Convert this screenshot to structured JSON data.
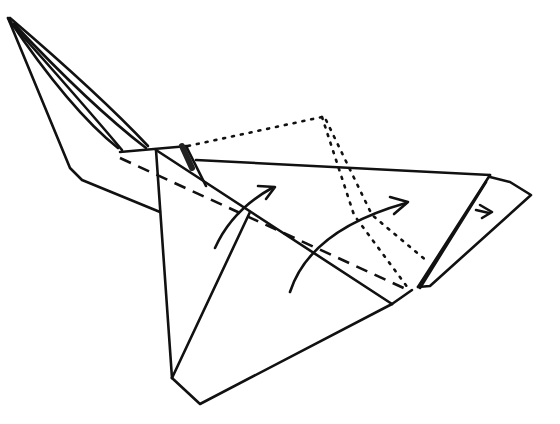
{
  "diagram": {
    "type": "origami-fold-step",
    "background": "#ffffff",
    "stroke_color": "#111111",
    "width": 560,
    "height": 424,
    "solid_paths": [
      {
        "name": "tail-outer-edge",
        "d": "M8 18 L70 168 L82 180 L160 212"
      },
      {
        "name": "tail-inner-edge-1",
        "d": "M8 18 Q70 110 118 148"
      },
      {
        "name": "tail-inner-edge-2",
        "d": "M10 22 Q80 100 122 150"
      },
      {
        "name": "tail-inner-edge-3",
        "d": "M14 24 Q90 105 146 148"
      },
      {
        "name": "tail-top-edge",
        "d": "M10 18 Q100 95 148 146"
      },
      {
        "name": "center-top-edge",
        "d": "M120 152 L188 146"
      },
      {
        "name": "nose-notch",
        "d": "M186 146 L196 166 L206 186"
      },
      {
        "name": "main-top-edge",
        "d": "M196 160 L490 175"
      },
      {
        "name": "left-body-edge",
        "d": "M156 150 L172 378"
      },
      {
        "name": "left-lower-crease",
        "d": "M172 378 L250 212"
      },
      {
        "name": "bottom-edge",
        "d": "M172 378 L200 404 L392 304"
      },
      {
        "name": "diagonal-center-crease",
        "d": "M156 150 L392 304"
      },
      {
        "name": "right-lower-edge",
        "d": "M392 304 L412 290"
      },
      {
        "name": "right-layer-edge-1",
        "d": "M490 175 L418 287"
      },
      {
        "name": "right-layer-edge-2",
        "d": "M486 182 L420 288"
      },
      {
        "name": "right-flap-outline",
        "d": "M490 177 L510 182 L531 195 L430 286 L418 287"
      }
    ],
    "dashed_paths": [
      {
        "name": "valley-fold-line",
        "d": "M120 158 L408 290"
      }
    ],
    "dotted_paths": [
      {
        "name": "hidden-edge-top",
        "d": "M188 146 L322 117"
      },
      {
        "name": "hidden-edge-right-1",
        "d": "M322 117 L354 215 L408 288"
      },
      {
        "name": "hidden-edge-right-2",
        "d": "M326 120 L372 215 L428 262"
      }
    ],
    "arrows": [
      {
        "name": "fold-arrow-left",
        "d": "M215 248 Q232 210 272 188",
        "head": "M258 186 L275 187 L266 199"
      },
      {
        "name": "fold-arrow-center",
        "d": "M290 292 Q310 230 406 203",
        "head": "M390 197 L408 202 L394 214"
      },
      {
        "name": "fold-arrow-right",
        "d": "M476 210 L489 213",
        "head": "M480 205 L492 212 L482 218"
      }
    ]
  }
}
